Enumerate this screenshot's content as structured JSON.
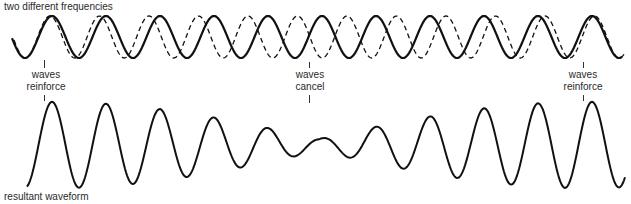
{
  "title": "two different frequencies",
  "colors": {
    "ink": "#111111",
    "text": "#2a2a2a"
  },
  "diagram": {
    "input_waves": [
      {
        "name": "wave A",
        "style": "solid",
        "cycles_in_view": 11,
        "relative_frequency": 1.0
      },
      {
        "name": "wave B",
        "style": "dashed",
        "cycles_in_view": 12,
        "relative_frequency": 1.1
      }
    ],
    "annotations": [
      {
        "text_line1": "waves",
        "text_line2": "reinforce",
        "position": "start"
      },
      {
        "text_line1": "waves",
        "text_line2": "cancel",
        "position": "middle"
      },
      {
        "text_line1": "waves",
        "text_line2": "reinforce",
        "position": "end"
      }
    ],
    "resultant": {
      "label": "resultant waveform",
      "description": "sum of the two waves; amplitude is largest where waves reinforce and smallest where they cancel"
    }
  }
}
